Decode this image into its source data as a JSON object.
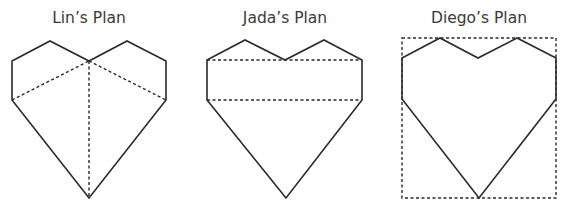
{
  "plans": [
    {
      "title": "Lin’s Plan",
      "title_center_x": 89,
      "heart": [
        [
          12,
          61
        ],
        [
          50,
          41
        ],
        [
          89,
          61
        ],
        [
          127,
          41
        ],
        [
          166,
          61
        ],
        [
          166,
          100
        ],
        [
          89,
          198
        ],
        [
          12,
          100
        ]
      ],
      "dashed_lines": [
        [
          [
            12,
            100
          ],
          [
            89,
            61
          ]
        ],
        [
          [
            89,
            61
          ],
          [
            166,
            100
          ]
        ],
        [
          [
            89,
            61
          ],
          [
            89,
            198
          ]
        ]
      ]
    },
    {
      "title": "Jada’s Plan",
      "title_center_x": 285,
      "heart": [
        [
          207,
          60
        ],
        [
          245,
          40
        ],
        [
          285,
          60
        ],
        [
          324,
          40
        ],
        [
          362,
          60
        ],
        [
          362,
          100
        ],
        [
          286,
          198
        ],
        [
          207,
          100
        ]
      ],
      "dashed_lines": [
        [
          [
            207,
            60
          ],
          [
            362,
            60
          ]
        ],
        [
          [
            207,
            100
          ],
          [
            362,
            100
          ]
        ]
      ]
    },
    {
      "title": "Diego’s Plan",
      "title_center_x": 479,
      "heart": [
        [
          402,
          58
        ],
        [
          440,
          38
        ],
        [
          478,
          58
        ],
        [
          517,
          38
        ],
        [
          556,
          58
        ],
        [
          556,
          99
        ],
        [
          479,
          198
        ],
        [
          402,
          99
        ]
      ],
      "dashed_rect": {
        "x": 402,
        "y": 38,
        "w": 154,
        "h": 160
      }
    }
  ]
}
